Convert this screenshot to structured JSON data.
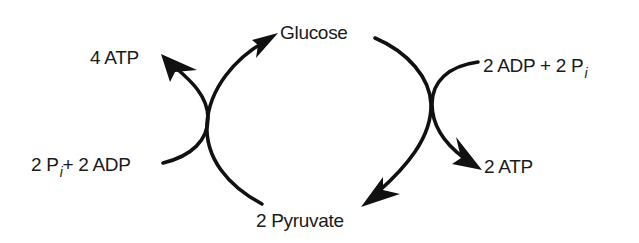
{
  "diagram": {
    "nodes": {
      "glucose": "Glucose",
      "pyruvate": "2 Pyruvate",
      "atp_out_left": "4 ATP",
      "atp_out_right": "2 ATP",
      "left_input": {
        "prefix": "2 P",
        "sub": "i",
        "suffix": "+ 2 ADP"
      },
      "right_input": {
        "prefix": "2 ADP + 2 P",
        "sub": "i"
      }
    },
    "edges": [
      {
        "from": "2 Pyruvate",
        "to": "Glucose",
        "coupled_from": "2 Pi + 2 ADP",
        "coupled_to": "4 ATP"
      },
      {
        "from": "Glucose",
        "to": "2 Pyruvate",
        "coupled_from": "2 ADP + 2 Pi",
        "coupled_to": "2 ATP"
      }
    ],
    "colors": {
      "stroke": "#111111",
      "text": "#1a1a1a",
      "background": "#ffffff"
    }
  }
}
